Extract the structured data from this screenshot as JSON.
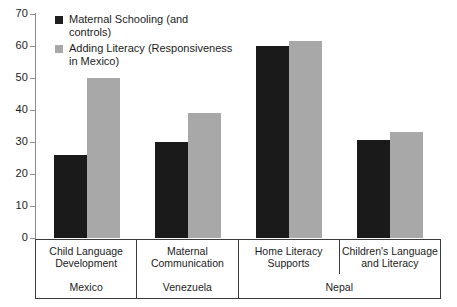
{
  "chart_data": {
    "type": "bar",
    "title": "",
    "xlabel": "",
    "ylabel": "",
    "ylim": [
      0,
      70
    ],
    "yticks": [
      0,
      10,
      20,
      30,
      40,
      50,
      60,
      70
    ],
    "grid": false,
    "legend_position": "top-left",
    "categories": [
      "Child Language\nDevelopment",
      "Maternal\nCommunication",
      "Home Literacy\nSupports",
      "Children's Language\nand Literacy"
    ],
    "groups": [
      {
        "label": "Mexico",
        "span": 1
      },
      {
        "label": "Venezuela",
        "span": 1
      },
      {
        "label": "Nepal",
        "span": 2
      }
    ],
    "series": [
      {
        "name": "Maternal Schooling (and\ncontrols)",
        "color": "#1a1a1a",
        "values": [
          26,
          30,
          60,
          30.5
        ]
      },
      {
        "name": "Adding Literacy (Responsiveness\nin Mexico)",
        "color": "#a8a8a8",
        "values": [
          50,
          39,
          61.5,
          33
        ]
      }
    ]
  },
  "axis": {
    "tick_labels": [
      "70",
      "60",
      "50",
      "40",
      "30",
      "20",
      "10",
      "0"
    ]
  },
  "legend": {
    "items": [
      {
        "label": "Maternal Schooling (and\ncontrols)",
        "swatch": "dark"
      },
      {
        "label": "Adding Literacy (Responsiveness\nin Mexico)",
        "swatch": "light"
      }
    ]
  }
}
